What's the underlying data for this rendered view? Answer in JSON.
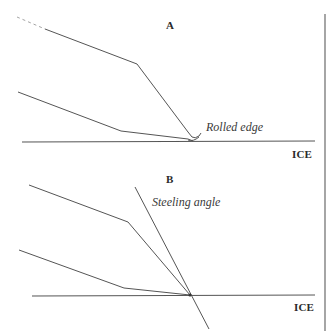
{
  "diagram": {
    "panels": [
      {
        "id": "A",
        "label": "A",
        "annotation": "Rolled edge",
        "surface_label": "ICE"
      },
      {
        "id": "B",
        "label": "B",
        "annotation": "Steeling angle",
        "surface_label": "ICE"
      }
    ],
    "colors": {
      "line": "#555555",
      "text": "#2a2a2a",
      "background": "#ffffff"
    }
  }
}
